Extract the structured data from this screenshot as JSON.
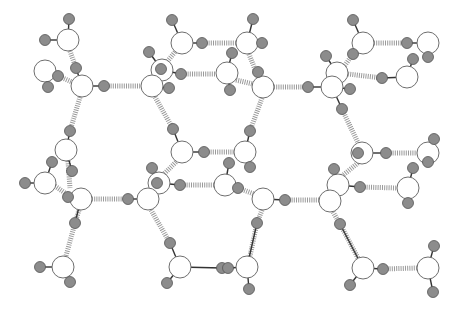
{
  "figure": {
    "width": 458,
    "height": 316,
    "colors": {
      "background": "#ffffff",
      "oxygen_fill": "#ffffff",
      "oxygen_stroke": "#6e6e6e",
      "hydrogen_fill": "#8c8c8c",
      "hydrogen_stroke": "#555555",
      "covalent_bond": "#333333",
      "hydrogen_bond": "#9a9a9a"
    }
  },
  "oxygens": [
    {
      "id": "O1",
      "x": 68,
      "y": 40,
      "r": 11
    },
    {
      "id": "O2",
      "x": 45,
      "y": 71,
      "r": 11
    },
    {
      "id": "O3",
      "x": 82,
      "y": 86,
      "r": 11
    },
    {
      "id": "O4",
      "x": 182,
      "y": 43,
      "r": 11
    },
    {
      "id": "O5",
      "x": 162,
      "y": 70,
      "r": 11
    },
    {
      "id": "O6",
      "x": 152,
      "y": 86,
      "r": 11
    },
    {
      "id": "O7",
      "x": 247,
      "y": 43,
      "r": 11
    },
    {
      "id": "O8",
      "x": 227,
      "y": 73,
      "r": 11
    },
    {
      "id": "O9",
      "x": 263,
      "y": 87,
      "r": 11
    },
    {
      "id": "O10",
      "x": 337,
      "y": 73,
      "r": 11
    },
    {
      "id": "O11",
      "x": 332,
      "y": 87,
      "r": 11
    },
    {
      "id": "O12",
      "x": 363,
      "y": 43,
      "r": 11
    },
    {
      "id": "O13",
      "x": 428,
      "y": 43,
      "r": 11
    },
    {
      "id": "O14",
      "x": 407,
      "y": 77,
      "r": 11
    },
    {
      "id": "O15",
      "x": 66,
      "y": 150,
      "r": 11
    },
    {
      "id": "O16",
      "x": 45,
      "y": 183,
      "r": 11
    },
    {
      "id": "O17",
      "x": 81,
      "y": 199,
      "r": 11
    },
    {
      "id": "O18",
      "x": 182,
      "y": 152,
      "r": 11
    },
    {
      "id": "O19",
      "x": 159,
      "y": 183,
      "r": 11
    },
    {
      "id": "O20",
      "x": 148,
      "y": 199,
      "r": 11
    },
    {
      "id": "O21",
      "x": 245,
      "y": 152,
      "r": 11
    },
    {
      "id": "O22",
      "x": 225,
      "y": 185,
      "r": 11
    },
    {
      "id": "O23",
      "x": 263,
      "y": 199,
      "r": 11
    },
    {
      "id": "O24",
      "x": 362,
      "y": 153,
      "r": 11
    },
    {
      "id": "O25",
      "x": 428,
      "y": 153,
      "r": 11
    },
    {
      "id": "O26",
      "x": 338,
      "y": 185,
      "r": 11
    },
    {
      "id": "O27",
      "x": 330,
      "y": 201,
      "r": 11
    },
    {
      "id": "O28",
      "x": 408,
      "y": 188,
      "r": 11
    },
    {
      "id": "O29",
      "x": 63,
      "y": 267,
      "r": 11
    },
    {
      "id": "O30",
      "x": 180,
      "y": 267,
      "r": 11
    },
    {
      "id": "O31",
      "x": 247,
      "y": 267,
      "r": 11
    },
    {
      "id": "O32",
      "x": 363,
      "y": 268,
      "r": 11
    },
    {
      "id": "O33",
      "x": 428,
      "y": 268,
      "r": 11
    }
  ],
  "hydrogens": [
    {
      "x": 69,
      "y": 19,
      "o": "O1"
    },
    {
      "x": 45,
      "y": 40,
      "o": "O1"
    },
    {
      "x": 58,
      "y": 76,
      "o": "O2"
    },
    {
      "x": 48,
      "y": 87,
      "o": "O2"
    },
    {
      "x": 76,
      "y": 68,
      "o": "O3"
    },
    {
      "x": 104,
      "y": 86,
      "o": "O3"
    },
    {
      "x": 172,
      "y": 20,
      "o": "O4"
    },
    {
      "x": 202,
      "y": 43,
      "o": "O4"
    },
    {
      "x": 149,
      "y": 52,
      "o": "O5"
    },
    {
      "x": 161,
      "y": 69,
      "o": "O5"
    },
    {
      "x": 181,
      "y": 74,
      "o": "O5"
    },
    {
      "x": 169,
      "y": 88,
      "o": "O6"
    },
    {
      "x": 253,
      "y": 19,
      "o": "O7"
    },
    {
      "x": 262,
      "y": 43,
      "o": "O7"
    },
    {
      "x": 232,
      "y": 53,
      "o": "O8"
    },
    {
      "x": 230,
      "y": 90,
      "o": "O8"
    },
    {
      "x": 258,
      "y": 72,
      "o": "O9"
    },
    {
      "x": 308,
      "y": 87,
      "o": "O11"
    },
    {
      "x": 326,
      "y": 56,
      "o": "O10"
    },
    {
      "x": 353,
      "y": 54,
      "o": "O12"
    },
    {
      "x": 350,
      "y": 89,
      "o": "O11"
    },
    {
      "x": 342,
      "y": 109,
      "o": "O11"
    },
    {
      "x": 353,
      "y": 20,
      "o": "O12"
    },
    {
      "x": 407,
      "y": 43,
      "o": "O13"
    },
    {
      "x": 428,
      "y": 57,
      "o": "O13"
    },
    {
      "x": 382,
      "y": 78,
      "o": "O14"
    },
    {
      "x": 413,
      "y": 59,
      "o": "O14"
    },
    {
      "x": 70,
      "y": 131,
      "o": "O15"
    },
    {
      "x": 72,
      "y": 171,
      "o": "O15"
    },
    {
      "x": 52,
      "y": 162,
      "o": "O16"
    },
    {
      "x": 25,
      "y": 183,
      "o": "O16"
    },
    {
      "x": 68,
      "y": 197,
      "o": "O17"
    },
    {
      "x": 75,
      "y": 223,
      "o": "O17"
    },
    {
      "x": 173,
      "y": 129,
      "o": "O18"
    },
    {
      "x": 204,
      "y": 152,
      "o": "O18"
    },
    {
      "x": 152,
      "y": 168,
      "o": "O19"
    },
    {
      "x": 157,
      "y": 183,
      "o": "O19"
    },
    {
      "x": 180,
      "y": 185,
      "o": "O19"
    },
    {
      "x": 128,
      "y": 199,
      "o": "O20"
    },
    {
      "x": 170,
      "y": 243,
      "o": "O30"
    },
    {
      "x": 250,
      "y": 131,
      "o": "O21"
    },
    {
      "x": 250,
      "y": 167,
      "o": "O21"
    },
    {
      "x": 229,
      "y": 163,
      "o": "O22"
    },
    {
      "x": 238,
      "y": 188,
      "o": "O22"
    },
    {
      "x": 285,
      "y": 200,
      "o": "O23"
    },
    {
      "x": 257,
      "y": 223,
      "o": "O31"
    },
    {
      "x": 358,
      "y": 153,
      "o": "O24"
    },
    {
      "x": 386,
      "y": 153,
      "o": "O24"
    },
    {
      "x": 434,
      "y": 139,
      "o": "O25"
    },
    {
      "x": 428,
      "y": 162,
      "o": "O25"
    },
    {
      "x": 334,
      "y": 169,
      "o": "O26"
    },
    {
      "x": 360,
      "y": 187,
      "o": "O26"
    },
    {
      "x": 413,
      "y": 168,
      "o": "O28"
    },
    {
      "x": 408,
      "y": 203,
      "o": "O28"
    },
    {
      "x": 340,
      "y": 224,
      "o": "O32"
    },
    {
      "x": 40,
      "y": 267,
      "o": "O29"
    },
    {
      "x": 70,
      "y": 282,
      "o": "O29"
    },
    {
      "x": 222,
      "y": 268,
      "o": "O30"
    },
    {
      "x": 167,
      "y": 283,
      "o": "O30"
    },
    {
      "x": 228,
      "y": 268,
      "o": "O31"
    },
    {
      "x": 249,
      "y": 289,
      "o": "O31"
    },
    {
      "x": 383,
      "y": 269,
      "o": "O32"
    },
    {
      "x": 350,
      "y": 285,
      "o": "O32"
    },
    {
      "x": 434,
      "y": 246,
      "o": "O33"
    },
    {
      "x": 433,
      "y": 292,
      "o": "O33"
    }
  ],
  "hydrogen_bonds": [
    {
      "x1": 70,
      "y1": 51,
      "x2": 76,
      "y2": 68
    },
    {
      "x1": 58,
      "y1": 76,
      "x2": 72,
      "y2": 82
    },
    {
      "x1": 104,
      "y1": 86,
      "x2": 141,
      "y2": 86
    },
    {
      "x1": 80,
      "y1": 97,
      "x2": 70,
      "y2": 131
    },
    {
      "x1": 202,
      "y1": 43,
      "x2": 236,
      "y2": 43
    },
    {
      "x1": 175,
      "y1": 52,
      "x2": 166,
      "y2": 63
    },
    {
      "x1": 181,
      "y1": 74,
      "x2": 216,
      "y2": 74
    },
    {
      "x1": 155,
      "y1": 97,
      "x2": 173,
      "y2": 129
    },
    {
      "x1": 249,
      "y1": 54,
      "x2": 256,
      "y2": 72
    },
    {
      "x1": 236,
      "y1": 80,
      "x2": 253,
      "y2": 84
    },
    {
      "x1": 263,
      "y1": 87,
      "x2": 308,
      "y2": 87
    },
    {
      "x1": 262,
      "y1": 98,
      "x2": 250,
      "y2": 131
    },
    {
      "x1": 374,
      "y1": 43,
      "x2": 407,
      "y2": 43
    },
    {
      "x1": 353,
      "y1": 54,
      "x2": 340,
      "y2": 72
    },
    {
      "x1": 348,
      "y1": 74,
      "x2": 382,
      "y2": 78
    },
    {
      "x1": 342,
      "y1": 109,
      "x2": 358,
      "y2": 143
    },
    {
      "x1": 68,
      "y1": 161,
      "x2": 70,
      "y2": 188
    },
    {
      "x1": 55,
      "y1": 186,
      "x2": 68,
      "y2": 195
    },
    {
      "x1": 92,
      "y1": 199,
      "x2": 128,
      "y2": 199
    },
    {
      "x1": 79,
      "y1": 210,
      "x2": 75,
      "y2": 223
    },
    {
      "x1": 75,
      "y1": 223,
      "x2": 66,
      "y2": 256
    },
    {
      "x1": 204,
      "y1": 152,
      "x2": 234,
      "y2": 152
    },
    {
      "x1": 176,
      "y1": 162,
      "x2": 164,
      "y2": 174
    },
    {
      "x1": 180,
      "y1": 185,
      "x2": 214,
      "y2": 185
    },
    {
      "x1": 151,
      "y1": 210,
      "x2": 170,
      "y2": 243
    },
    {
      "x1": 248,
      "y1": 162,
      "x2": 250,
      "y2": 167
    },
    {
      "x1": 238,
      "y1": 188,
      "x2": 254,
      "y2": 194
    },
    {
      "x1": 285,
      "y1": 200,
      "x2": 319,
      "y2": 200
    },
    {
      "x1": 262,
      "y1": 210,
      "x2": 257,
      "y2": 223
    },
    {
      "x1": 257,
      "y1": 223,
      "x2": 250,
      "y2": 256
    },
    {
      "x1": 386,
      "y1": 153,
      "x2": 417,
      "y2": 153
    },
    {
      "x1": 358,
      "y1": 163,
      "x2": 342,
      "y2": 176
    },
    {
      "x1": 360,
      "y1": 187,
      "x2": 397,
      "y2": 188
    },
    {
      "x1": 333,
      "y1": 212,
      "x2": 340,
      "y2": 224
    },
    {
      "x1": 340,
      "y1": 224,
      "x2": 358,
      "y2": 258
    },
    {
      "x1": 383,
      "y1": 269,
      "x2": 417,
      "y2": 268
    }
  ]
}
